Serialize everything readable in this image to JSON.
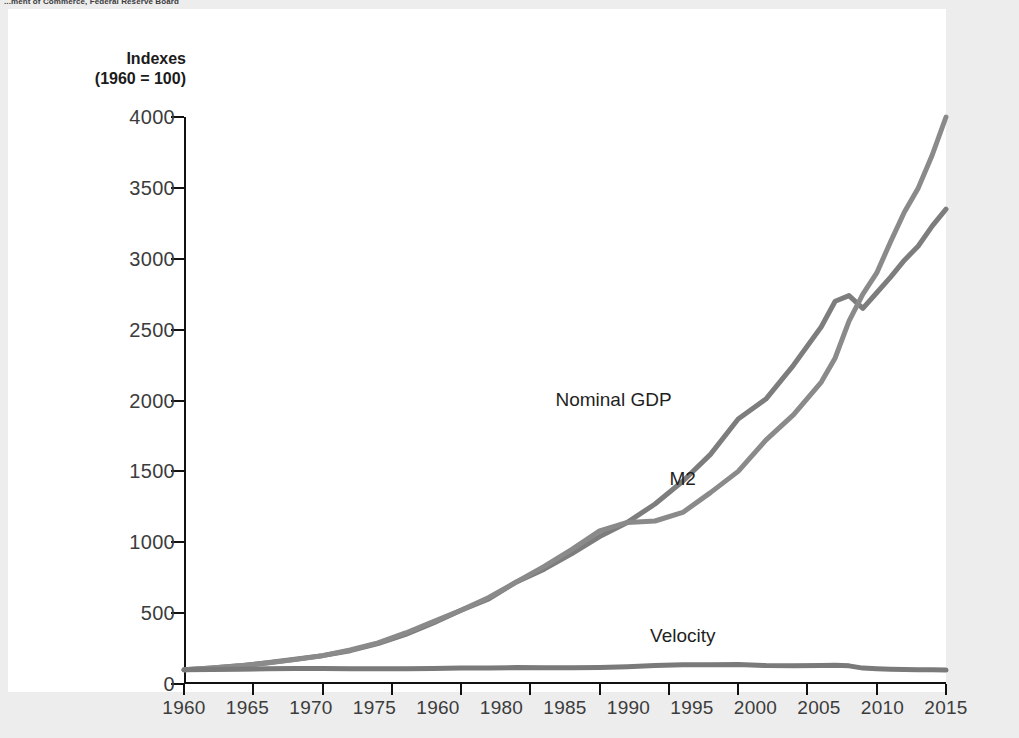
{
  "source_note": "...ment of Commerce, Federal Reserve Board",
  "axis_title": {
    "line1": "Indexes",
    "line2": "(1960 = 100)"
  },
  "colors": {
    "page_background": "#ededed",
    "panel_background": "#ffffff",
    "axis": "#111111",
    "tick_label": "#3c3c3c",
    "nominal_gdp_line": "#7d7d7d",
    "m2_line": "#8a8a8a",
    "velocity_line": "#7a7a7a"
  },
  "series_labels": {
    "nominal_gdp": "Nominal GDP",
    "m2": "M2",
    "velocity": "Velocity"
  },
  "chart_data": {
    "type": "line",
    "title": "",
    "subtitle": "",
    "xlabel": "",
    "ylabel": "Indexes (1960 = 100)",
    "xlim": [
      1960,
      2015
    ],
    "ylim": [
      0,
      4000
    ],
    "grid": false,
    "legend": "inline-annotations",
    "y_ticks": [
      0,
      500,
      1000,
      1500,
      2000,
      2500,
      3000,
      3500,
      4000
    ],
    "x_ticks": [
      1960,
      1965,
      1970,
      1975,
      1980,
      1985,
      1990,
      1995,
      2000,
      2005,
      2010,
      2015
    ],
    "x_tick_labels": [
      "1960",
      "1965",
      "1970",
      "1975",
      "1960",
      "1980",
      "1985",
      "1990",
      "1995",
      "2000",
      "2005",
      "2010",
      "2015"
    ],
    "x_tick_label_note": "The fifth printed label reads 1960 in the scan; the tick position corresponds to 1980.",
    "x": [
      1960,
      1962,
      1964,
      1966,
      1968,
      1970,
      1972,
      1974,
      1976,
      1978,
      1980,
      1982,
      1984,
      1986,
      1988,
      1990,
      1992,
      1994,
      1996,
      1998,
      2000,
      2002,
      2004,
      2006,
      2007,
      2008,
      2009,
      2010,
      2011,
      2012,
      2013,
      2014,
      2015
    ],
    "series": [
      {
        "name": "Nominal GDP",
        "values": [
          100,
          112,
          128,
          150,
          175,
          200,
          235,
          285,
          350,
          430,
          520,
          600,
          720,
          810,
          920,
          1040,
          1140,
          1270,
          1430,
          1620,
          1870,
          2010,
          2250,
          2520,
          2700,
          2740,
          2650,
          2760,
          2870,
          2990,
          3090,
          3230,
          3350
        ],
        "label_position": {
          "x": 1991,
          "y": 2000
        }
      },
      {
        "name": "M2",
        "values": [
          100,
          112,
          128,
          148,
          172,
          200,
          240,
          290,
          360,
          440,
          520,
          610,
          720,
          830,
          950,
          1080,
          1140,
          1150,
          1210,
          1350,
          1500,
          1720,
          1900,
          2130,
          2300,
          2560,
          2750,
          2900,
          3120,
          3330,
          3500,
          3730,
          4000
        ],
        "label_position": {
          "x": 1996,
          "y": 1440
        }
      },
      {
        "name": "Velocity",
        "values": [
          100,
          102,
          104,
          107,
          109,
          110,
          108,
          107,
          108,
          110,
          113,
          112,
          116,
          114,
          114,
          116,
          122,
          130,
          136,
          136,
          138,
          130,
          128,
          130,
          133,
          128,
          112,
          108,
          104,
          102,
          101,
          100,
          98
        ],
        "label_position": {
          "x": 1996,
          "y": 330
        }
      }
    ]
  }
}
